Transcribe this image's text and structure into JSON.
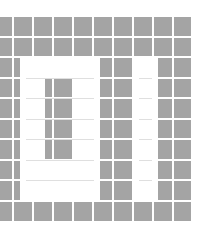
{
  "image": {
    "width": 207,
    "height": 229,
    "background": "#ffffff",
    "description": "Gray tile grid with white glyphs forming '01'"
  },
  "grid": {
    "cell_color": "#a4a4a4",
    "gap_color": "#ffffff",
    "columns": [
      {
        "x": 0,
        "w": 12
      },
      {
        "x": 14,
        "w": 18
      },
      {
        "x": 34,
        "w": 18
      },
      {
        "x": 54,
        "w": 18
      },
      {
        "x": 74,
        "w": 18
      },
      {
        "x": 94,
        "w": 18
      },
      {
        "x": 114,
        "w": 18
      },
      {
        "x": 134,
        "w": 18
      },
      {
        "x": 154,
        "w": 18
      },
      {
        "x": 174,
        "w": 17
      }
    ],
    "rows": [
      {
        "y": 17,
        "h": 19
      },
      {
        "y": 38,
        "h": 18
      },
      {
        "y": 58,
        "h": 19
      },
      {
        "y": 79,
        "h": 18
      },
      {
        "y": 99,
        "h": 19
      },
      {
        "y": 120,
        "h": 18
      },
      {
        "y": 140,
        "h": 19
      },
      {
        "y": 161,
        "h": 18
      },
      {
        "y": 181,
        "h": 19
      },
      {
        "y": 202,
        "h": 19
      }
    ]
  },
  "glyphs": [
    {
      "name": "zero",
      "label": "0",
      "color": "#ffffff",
      "outer": {
        "x": 20,
        "y": 58,
        "w": 80,
        "h": 142
      },
      "hole": {
        "x": 45,
        "y": 79,
        "w": 28,
        "h": 82
      }
    },
    {
      "name": "one",
      "label": "1",
      "color": "#ffffff",
      "outer": {
        "x": 133,
        "y": 58,
        "w": 25,
        "h": 142
      }
    }
  ],
  "faint_lines": {
    "color": "#c9c9c9",
    "horizontal_y": [
      78,
      98,
      119,
      139,
      160,
      180
    ],
    "vertical_x": [
      45,
      73
    ]
  }
}
